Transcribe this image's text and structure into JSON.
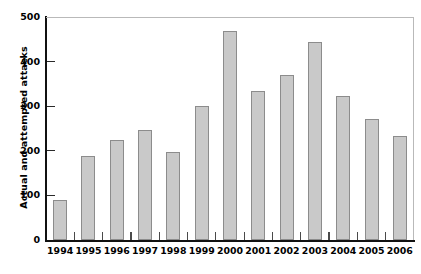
{
  "chart_data": {
    "type": "bar",
    "title": "",
    "subtitle": "",
    "xlabel": "",
    "ylabel": "Actual and attempted attacks",
    "categories": [
      "1994",
      "1995",
      "1996",
      "1997",
      "1998",
      "1999",
      "2000",
      "2001",
      "2002",
      "2003",
      "2004",
      "2005",
      "2006"
    ],
    "values": [
      90,
      188,
      225,
      247,
      198,
      300,
      469,
      335,
      370,
      445,
      323,
      271,
      233
    ],
    "series": [
      {
        "name": "Actual and attempted attacks",
        "values": [
          90,
          188,
          225,
          247,
          198,
          300,
          469,
          335,
          370,
          445,
          323,
          271,
          233
        ]
      }
    ],
    "ylim": [
      0,
      500
    ],
    "ytick_labels": [
      "0",
      "100",
      "200",
      "300",
      "400",
      "500"
    ],
    "ytick_values": [
      0,
      100,
      200,
      300,
      400,
      500
    ],
    "grid": false,
    "legend": false,
    "legend_position": "none",
    "bar_fill_color": "#c9c9c9",
    "bar_border_color": "#8c8c8c",
    "axis_color": "#111111",
    "frame_color": "#b9b9b9"
  },
  "axes": {
    "y_title": "Actual and attempted attacks"
  }
}
